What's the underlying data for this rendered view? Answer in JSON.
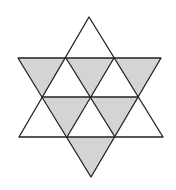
{
  "figure": {
    "title": "",
    "colors": {
      "shaded": "#d4d4d4",
      "stroke": "#222222",
      "background": "#ffffff"
    },
    "shaded_triangles": [
      "18,58 66,58 43,97",
      "66,58 114,58 90,97",
      "114,58 161,58 138,97",
      "43,97 90,97 67,137",
      "90,97 138,97 115,137",
      "67,137 115,137 91,177"
    ],
    "outlines": {
      "up_triangle": "89,17 163,137 19,137",
      "down_triangle": "18,58 161,58 91,177",
      "middle_line": "43,97 138,97",
      "inner_lines": [
        "66,58 115,137",
        "114,58 67,137"
      ]
    },
    "counts": {
      "total_small_triangles": 12,
      "shaded": 6
    }
  }
}
